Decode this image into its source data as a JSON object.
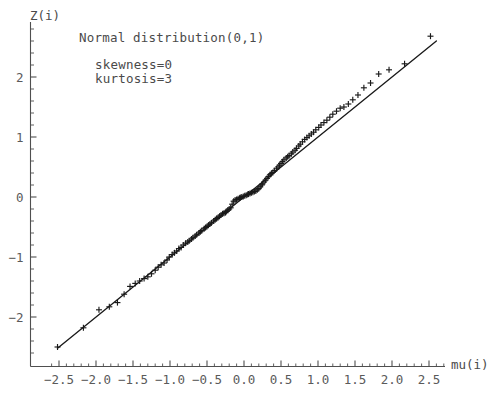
{
  "chart_data": {
    "type": "scatter",
    "title": "",
    "xlabel": "mu(i)",
    "ylabel": "Z(i)",
    "xlim": [
      -2.8,
      2.9
    ],
    "ylim": [
      -2.75,
      2.85
    ],
    "grid": false,
    "legend": "none",
    "annotations": [
      "Normal distribution(0,1)",
      "skewness=0",
      "kurtosis=3"
    ],
    "xticks": [
      "-2.5",
      "-2.0",
      "-1.5",
      "-1.0",
      "-0.5",
      "0.0",
      "0.5",
      "1.0",
      "1.5",
      "2.0",
      "2.5"
    ],
    "xtick_values": [
      -2.5,
      -2.0,
      -1.5,
      -1.0,
      -0.5,
      0.0,
      0.5,
      1.0,
      1.5,
      2.0,
      2.5
    ],
    "yticks": [
      "2",
      "1",
      "0",
      "-1",
      "-2"
    ],
    "ytick_values": [
      2,
      1,
      0,
      -1,
      -2
    ],
    "minor_tick_step": 0.1,
    "marker": "plus",
    "marker_color": "#1a1a1a",
    "line_color": "#1a1a1a",
    "reference_line": {
      "label": "y = x",
      "slope": 1.0,
      "intercept": 0.0,
      "x_start": -2.52,
      "x_end": 2.6
    },
    "series": [
      {
        "name": "sample quantiles",
        "x": [
          -2.52,
          -2.17,
          -1.96,
          -1.82,
          -1.71,
          -1.62,
          -1.54,
          -1.47,
          -1.41,
          -1.35,
          -1.3,
          -1.25,
          -1.2,
          -1.16,
          -1.12,
          -1.08,
          -1.04,
          -1.01,
          -0.97,
          -0.94,
          -0.91,
          -0.88,
          -0.85,
          -0.82,
          -0.79,
          -0.76,
          -0.74,
          -0.71,
          -0.69,
          -0.66,
          -0.64,
          -0.61,
          -0.59,
          -0.57,
          -0.54,
          -0.52,
          -0.5,
          -0.48,
          -0.46,
          -0.44,
          -0.41,
          -0.39,
          -0.37,
          -0.35,
          -0.33,
          -0.31,
          -0.29,
          -0.27,
          -0.25,
          -0.24,
          -0.22,
          -0.2,
          -0.18,
          -0.16,
          -0.14,
          -0.12,
          -0.1,
          -0.08,
          -0.06,
          -0.05,
          -0.03,
          -0.01,
          0.01,
          0.03,
          0.05,
          0.06,
          0.08,
          0.1,
          0.12,
          0.14,
          0.16,
          0.18,
          0.2,
          0.22,
          0.24,
          0.25,
          0.27,
          0.29,
          0.31,
          0.33,
          0.35,
          0.37,
          0.39,
          0.41,
          0.44,
          0.46,
          0.48,
          0.5,
          0.52,
          0.54,
          0.57,
          0.59,
          0.61,
          0.64,
          0.66,
          0.69,
          0.71,
          0.74,
          0.76,
          0.79,
          0.82,
          0.85,
          0.88,
          0.91,
          0.94,
          0.97,
          1.01,
          1.04,
          1.08,
          1.12,
          1.16,
          1.2,
          1.25,
          1.3,
          1.35,
          1.41,
          1.47,
          1.54,
          1.62,
          1.71,
          1.82,
          1.96,
          2.17,
          2.52
        ],
        "y": [
          -2.5,
          -2.18,
          -1.88,
          -1.83,
          -1.76,
          -1.62,
          -1.49,
          -1.44,
          -1.4,
          -1.36,
          -1.33,
          -1.28,
          -1.22,
          -1.17,
          -1.13,
          -1.1,
          -1.05,
          -1.0,
          -0.96,
          -0.93,
          -0.9,
          -0.86,
          -0.84,
          -0.8,
          -0.77,
          -0.75,
          -0.73,
          -0.7,
          -0.68,
          -0.65,
          -0.63,
          -0.6,
          -0.58,
          -0.56,
          -0.53,
          -0.51,
          -0.49,
          -0.47,
          -0.45,
          -0.43,
          -0.4,
          -0.38,
          -0.36,
          -0.34,
          -0.32,
          -0.3,
          -0.28,
          -0.27,
          -0.26,
          -0.24,
          -0.22,
          -0.2,
          -0.18,
          -0.12,
          -0.07,
          -0.05,
          -0.04,
          -0.03,
          -0.02,
          -0.01,
          0.0,
          0.01,
          0.02,
          0.03,
          0.04,
          0.05,
          0.06,
          0.07,
          0.08,
          0.09,
          0.1,
          0.12,
          0.14,
          0.17,
          0.2,
          0.22,
          0.25,
          0.28,
          0.31,
          0.34,
          0.37,
          0.39,
          0.41,
          0.44,
          0.47,
          0.5,
          0.53,
          0.56,
          0.59,
          0.62,
          0.65,
          0.67,
          0.69,
          0.72,
          0.75,
          0.78,
          0.81,
          0.85,
          0.88,
          0.92,
          0.96,
          0.99,
          1.02,
          1.05,
          1.08,
          1.12,
          1.16,
          1.2,
          1.24,
          1.28,
          1.33,
          1.38,
          1.43,
          1.48,
          1.5,
          1.55,
          1.62,
          1.7,
          1.82,
          1.9,
          2.05,
          2.12,
          2.22,
          2.68
        ]
      }
    ]
  },
  "axis": {
    "y_name": "Z(i)",
    "x_name": "mu(i)"
  }
}
